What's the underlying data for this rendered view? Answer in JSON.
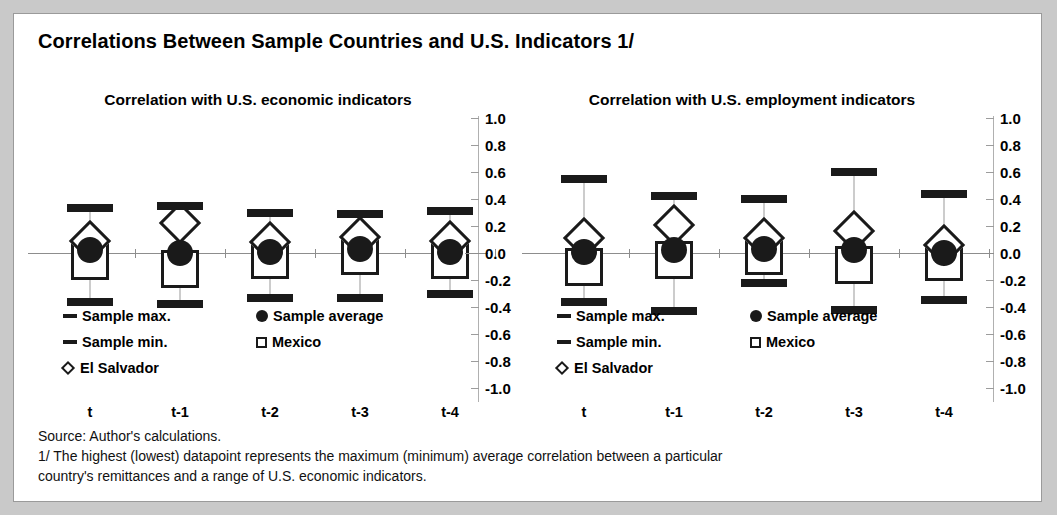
{
  "figure": {
    "title": "Correlations Between Sample Countries and U.S. Indicators 1/",
    "source": "Source: Author's calculations.",
    "footnote_line1": "1/ The highest (lowest) datapoint represents the maximum (minimum) average correlation between a particular",
    "footnote_line2": "country's remittances and a range of U.S. economic indicators."
  },
  "legend": {
    "sample_max": "Sample max.",
    "sample_min": "Sample min.",
    "el_salvador": "El Salvador",
    "sample_average": "Sample average",
    "mexico": "Mexico"
  },
  "axis": {
    "ticks": [
      "1.0",
      "0.8",
      "0.6",
      "0.4",
      "0.2",
      "0.0",
      "-0.2",
      "-0.4",
      "-0.6",
      "-0.8",
      "-1.0"
    ]
  },
  "chart_data": [
    {
      "type": "scatter",
      "title": "Correlation with U.S. economic indicators",
      "xlabel": "",
      "ylabel": "",
      "ylim": [
        -1.0,
        1.0
      ],
      "ytick_step": 0.2,
      "grid": false,
      "legend_position": "inside-bottom",
      "categories": [
        "t",
        "t-1",
        "t-2",
        "t-3",
        "t-4"
      ],
      "series": [
        {
          "name": "Sample max.",
          "marker": "dash",
          "values": [
            0.33,
            0.35,
            0.3,
            0.29,
            0.31
          ]
        },
        {
          "name": "Sample min.",
          "marker": "dash",
          "values": [
            -0.36,
            -0.38,
            -0.33,
            -0.33,
            -0.3
          ]
        },
        {
          "name": "El Salvador",
          "marker": "diamond",
          "values": [
            0.09,
            0.22,
            0.08,
            0.12,
            0.09
          ]
        },
        {
          "name": "Sample average",
          "marker": "circle",
          "values": [
            0.02,
            0.0,
            0.01,
            0.03,
            0.01
          ]
        },
        {
          "name": "Mexico",
          "marker": "square",
          "values": [
            -0.06,
            -0.12,
            -0.05,
            -0.02,
            -0.05
          ]
        }
      ]
    },
    {
      "type": "scatter",
      "title": "Correlation with U.S. employment indicators",
      "xlabel": "",
      "ylabel": "",
      "ylim": [
        -1.0,
        1.0
      ],
      "ytick_step": 0.2,
      "grid": false,
      "legend_position": "inside-bottom",
      "categories": [
        "t",
        "t-1",
        "t-2",
        "t-3",
        "t-4"
      ],
      "series": [
        {
          "name": "Sample max.",
          "marker": "dash",
          "values": [
            0.55,
            0.42,
            0.4,
            0.6,
            0.44
          ]
        },
        {
          "name": "Sample min.",
          "marker": "dash",
          "values": [
            -0.36,
            -0.43,
            -0.22,
            -0.42,
            -0.35
          ]
        },
        {
          "name": "El Salvador",
          "marker": "diamond",
          "values": [
            0.11,
            0.21,
            0.11,
            0.16,
            0.06
          ]
        },
        {
          "name": "Sample average",
          "marker": "circle",
          "values": [
            0.01,
            0.02,
            0.03,
            0.02,
            0.0
          ]
        },
        {
          "name": "Mexico",
          "marker": "square",
          "values": [
            -0.1,
            -0.05,
            -0.02,
            -0.09,
            -0.07
          ]
        }
      ]
    }
  ]
}
